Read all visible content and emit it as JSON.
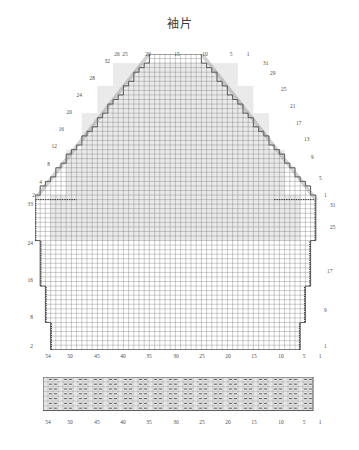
{
  "page": {
    "title": "袖片",
    "background": "#ffffff",
    "ink": "#2b2b2b"
  },
  "chart_data": {
    "type": "heatmap",
    "title": "袖片",
    "subtitle": "",
    "xlabel": "",
    "ylabel": "",
    "grid": true,
    "legend_position": "none",
    "main_grid": {
      "columns": 54,
      "rows": 64,
      "cell_px": 5.2,
      "x_ticks_bottom": [
        54,
        50,
        45,
        40,
        35,
        30,
        25,
        20,
        15,
        10,
        5,
        1
      ],
      "x_ticks_top": [
        26,
        25,
        20,
        15,
        10,
        5,
        1
      ],
      "y_ticks_left_upper": [
        32,
        28,
        24,
        20,
        16,
        12,
        8,
        4,
        2
      ],
      "y_ticks_right_upper": [
        31,
        29,
        25,
        21,
        17,
        13,
        9,
        5
      ],
      "y_ticks_left_lower": [
        33,
        24,
        16,
        8,
        2
      ],
      "y_ticks_right_lower": [
        1,
        31,
        25,
        17,
        9,
        1
      ],
      "shape": "sleeve cap trapezoid with stepped decreases, straight lower body with stepped increases"
    },
    "rib_grid": {
      "columns": 54,
      "rows": 7,
      "cell_px": 5.0,
      "x_ticks": [
        54,
        50,
        45,
        40,
        35,
        30,
        25,
        20,
        15,
        10,
        5,
        1
      ],
      "symbol": "purl-dash",
      "pattern": "ribbing"
    }
  },
  "labels": {
    "top": [
      {
        "text": "26",
        "x": 117,
        "y": 52
      },
      {
        "text": "25",
        "x": 125,
        "y": 52
      },
      {
        "text": "20",
        "x": 148,
        "y": 52
      },
      {
        "text": "15",
        "x": 177,
        "y": 52
      },
      {
        "text": "10",
        "x": 205,
        "y": 52
      },
      {
        "text": "5",
        "x": 231,
        "y": 52
      },
      {
        "text": "1",
        "x": 248,
        "y": 52
      }
    ],
    "left_upper": [
      {
        "text": "32",
        "x": 110,
        "y": 62
      },
      {
        "text": "28",
        "x": 95,
        "y": 79
      },
      {
        "text": "24",
        "x": 82,
        "y": 96
      },
      {
        "text": "20",
        "x": 72,
        "y": 113
      },
      {
        "text": "16",
        "x": 64,
        "y": 130
      },
      {
        "text": "12",
        "x": 57,
        "y": 147
      },
      {
        "text": "8",
        "x": 50,
        "y": 165
      },
      {
        "text": "4",
        "x": 42,
        "y": 183
      },
      {
        "text": "2",
        "x": 35,
        "y": 196
      }
    ],
    "right_upper": [
      {
        "text": "31",
        "x": 263,
        "y": 64
      },
      {
        "text": "29",
        "x": 270,
        "y": 74
      },
      {
        "text": "25",
        "x": 281,
        "y": 90
      },
      {
        "text": "21",
        "x": 290,
        "y": 107
      },
      {
        "text": "17",
        "x": 296,
        "y": 124
      },
      {
        "text": "13",
        "x": 304,
        "y": 140
      },
      {
        "text": "9",
        "x": 311,
        "y": 158
      },
      {
        "text": "5",
        "x": 319,
        "y": 179
      }
    ],
    "left_lower": [
      {
        "text": "33",
        "x": 33,
        "y": 205
      },
      {
        "text": "24",
        "x": 33,
        "y": 244
      },
      {
        "text": "16",
        "x": 33,
        "y": 281
      },
      {
        "text": "8",
        "x": 33,
        "y": 318
      },
      {
        "text": "2",
        "x": 33,
        "y": 347
      }
    ],
    "right_lower": [
      {
        "text": "1",
        "x": 324,
        "y": 196
      },
      {
        "text": "31",
        "x": 330,
        "y": 206
      },
      {
        "text": "25",
        "x": 330,
        "y": 228
      },
      {
        "text": "17",
        "x": 327,
        "y": 272
      },
      {
        "text": "9",
        "x": 324,
        "y": 311
      },
      {
        "text": "1",
        "x": 324,
        "y": 347
      }
    ],
    "bottom_main": [
      {
        "text": "54",
        "x": 48,
        "y": 354
      },
      {
        "text": "50",
        "x": 70,
        "y": 354
      },
      {
        "text": "45",
        "x": 97,
        "y": 354
      },
      {
        "text": "40",
        "x": 123,
        "y": 354
      },
      {
        "text": "35",
        "x": 149,
        "y": 354
      },
      {
        "text": "30",
        "x": 176,
        "y": 354
      },
      {
        "text": "25",
        "x": 202,
        "y": 354
      },
      {
        "text": "20",
        "x": 228,
        "y": 354
      },
      {
        "text": "15",
        "x": 254,
        "y": 354
      },
      {
        "text": "10",
        "x": 281,
        "y": 354
      },
      {
        "text": "5",
        "x": 304,
        "y": 354
      },
      {
        "text": "1",
        "x": 320,
        "y": 354
      }
    ],
    "bottom_rib": [
      {
        "text": "54",
        "x": 48,
        "y": 420
      },
      {
        "text": "50",
        "x": 70,
        "y": 420
      },
      {
        "text": "45",
        "x": 97,
        "y": 420
      },
      {
        "text": "40",
        "x": 123,
        "y": 420
      },
      {
        "text": "35",
        "x": 149,
        "y": 420
      },
      {
        "text": "30",
        "x": 176,
        "y": 420
      },
      {
        "text": "25",
        "x": 202,
        "y": 420
      },
      {
        "text": "20",
        "x": 228,
        "y": 420
      },
      {
        "text": "15",
        "x": 254,
        "y": 420
      },
      {
        "text": "10",
        "x": 281,
        "y": 420
      },
      {
        "text": "5",
        "x": 304,
        "y": 420
      },
      {
        "text": "1",
        "x": 320,
        "y": 420
      }
    ]
  }
}
